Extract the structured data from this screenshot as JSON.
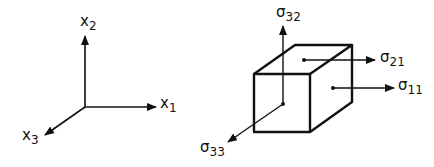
{
  "axes_figure": {
    "x1": {
      "base": "x",
      "sub": "1"
    },
    "x2": {
      "base": "x",
      "sub": "2"
    },
    "x3": {
      "base": "x",
      "sub": "3"
    }
  },
  "cube_figure": {
    "s32": {
      "base": "σ",
      "sub": "32"
    },
    "s21": {
      "base": "σ",
      "sub": "21"
    },
    "s11": {
      "base": "σ",
      "sub": "11"
    },
    "s33": {
      "base": "σ",
      "sub": "33"
    }
  },
  "colors": {
    "stroke": "#111111",
    "background": "#ffffff"
  }
}
